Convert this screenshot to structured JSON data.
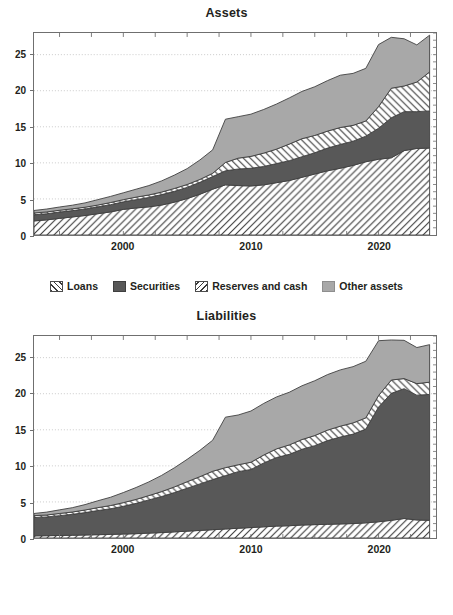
{
  "figure": {
    "background": "#ffffff",
    "colors": {
      "dark_gray": "#585858",
      "light_gray": "#a8a8a8",
      "hatch": "#3a3a3a",
      "axis": "#6f6f6f",
      "grid": "#bdbdbd",
      "text": "#231f20"
    }
  },
  "panels": [
    {
      "id": "assets",
      "title": "Assets",
      "legend": [
        {
          "label": "Loans",
          "swatch": "forward-hatch-icon"
        },
        {
          "label": "Securities",
          "swatch": "dark-gray-square-icon"
        },
        {
          "label": "Reserves and cash",
          "swatch": "back-hatch-icon"
        },
        {
          "label": "Other assets",
          "swatch": "light-gray-square-icon"
        }
      ]
    },
    {
      "id": "liabilities",
      "title": "Liabilities",
      "legend": [
        {
          "label": "Equity",
          "swatch": "forward-hatch-icon"
        },
        {
          "label": "Deposits",
          "swatch": "dark-gray-square-icon"
        },
        {
          "label": "Fed funds, repos",
          "swatch": "back-hatch-icon"
        },
        {
          "label": "Other liabilities",
          "swatch": "light-gray-square-icon"
        }
      ]
    }
  ],
  "chart_data": [
    {
      "type": "area",
      "id": "assets",
      "title": "Assets",
      "xlabel": "",
      "ylabel": "",
      "stacked": true,
      "grid": true,
      "legend_position": "below",
      "xlim": [
        1993,
        2024.5
      ],
      "ylim": [
        0,
        28
      ],
      "yticks": [
        0,
        5,
        10,
        15,
        20,
        25
      ],
      "xticks_labeled": [
        2000,
        2010,
        2020
      ],
      "x": [
        1993,
        1994,
        1995,
        1996,
        1997,
        1998,
        1999,
        2000,
        2001,
        2002,
        2003,
        2004,
        2005,
        2006,
        2007,
        2008,
        2009,
        2010,
        2011,
        2012,
        2013,
        2014,
        2015,
        2016,
        2017,
        2018,
        2019,
        2020,
        2021,
        2022,
        2023,
        2024
      ],
      "series": [
        {
          "name": "Loans",
          "values": [
            1.95,
            2.1,
            2.3,
            2.5,
            2.7,
            2.95,
            3.2,
            3.55,
            3.75,
            3.9,
            4.15,
            4.55,
            5.05,
            5.65,
            6.35,
            6.95,
            6.85,
            6.8,
            6.95,
            7.25,
            7.55,
            8.0,
            8.45,
            8.9,
            9.25,
            9.65,
            10.15,
            10.5,
            10.7,
            11.7,
            12.0,
            12.05
          ]
        },
        {
          "name": "Securities",
          "values": [
            0.85,
            0.85,
            0.88,
            0.88,
            0.9,
            0.95,
            1.0,
            1.05,
            1.15,
            1.3,
            1.45,
            1.5,
            1.55,
            1.65,
            1.75,
            1.95,
            2.3,
            2.45,
            2.55,
            2.65,
            2.75,
            2.85,
            2.95,
            3.15,
            3.3,
            3.35,
            3.55,
            4.3,
            5.55,
            5.4,
            5.1,
            5.15
          ]
        },
        {
          "name": "Reserves and cash",
          "values": [
            0.25,
            0.25,
            0.25,
            0.25,
            0.25,
            0.25,
            0.3,
            0.3,
            0.35,
            0.35,
            0.35,
            0.4,
            0.4,
            0.4,
            0.45,
            1.15,
            1.5,
            1.65,
            1.85,
            2.0,
            2.3,
            2.5,
            2.4,
            2.35,
            2.35,
            2.2,
            2.1,
            3.0,
            4.1,
            3.55,
            4.1,
            5.4
          ]
        },
        {
          "name": "Other assets",
          "values": [
            0.35,
            0.4,
            0.45,
            0.5,
            0.6,
            0.75,
            0.85,
            0.95,
            1.1,
            1.3,
            1.55,
            1.85,
            2.2,
            2.7,
            3.25,
            6.0,
            5.75,
            5.85,
            6.05,
            6.25,
            6.4,
            6.55,
            6.75,
            7.0,
            7.25,
            7.2,
            7.3,
            8.6,
            7.05,
            6.55,
            5.15,
            5.1
          ]
        }
      ]
    },
    {
      "type": "area",
      "id": "liabilities",
      "title": "Liabilities",
      "xlabel": "",
      "ylabel": "",
      "stacked": true,
      "grid": true,
      "legend_position": "below",
      "xlim": [
        1993,
        2024.5
      ],
      "ylim": [
        0,
        28
      ],
      "yticks": [
        0,
        5,
        10,
        15,
        20,
        25
      ],
      "xticks_labeled": [
        2000,
        2010,
        2020
      ],
      "x": [
        1993,
        1994,
        1995,
        1996,
        1997,
        1998,
        1999,
        2000,
        2001,
        2002,
        2003,
        2004,
        2005,
        2006,
        2007,
        2008,
        2009,
        2010,
        2011,
        2012,
        2013,
        2014,
        2015,
        2016,
        2017,
        2018,
        2019,
        2020,
        2021,
        2022,
        2023,
        2024
      ],
      "series": [
        {
          "name": "Equity",
          "values": [
            0.3,
            0.32,
            0.35,
            0.38,
            0.42,
            0.46,
            0.5,
            0.55,
            0.6,
            0.68,
            0.75,
            0.85,
            0.95,
            1.05,
            1.15,
            1.25,
            1.35,
            1.45,
            1.55,
            1.65,
            1.7,
            1.8,
            1.85,
            1.9,
            1.95,
            2.0,
            2.1,
            2.25,
            2.45,
            2.7,
            2.5,
            2.45
          ]
        },
        {
          "name": "Deposits",
          "values": [
            2.55,
            2.6,
            2.75,
            2.9,
            3.1,
            3.35,
            3.55,
            3.85,
            4.2,
            4.6,
            5.0,
            5.45,
            5.95,
            6.45,
            6.95,
            7.4,
            7.85,
            8.05,
            8.85,
            9.5,
            9.9,
            10.5,
            10.95,
            11.6,
            12.05,
            12.4,
            13.0,
            15.9,
            17.6,
            18.0,
            17.3,
            17.45
          ]
        },
        {
          "name": "Fed funds, repos",
          "values": [
            0.25,
            0.27,
            0.3,
            0.32,
            0.36,
            0.4,
            0.45,
            0.5,
            0.55,
            0.6,
            0.68,
            0.78,
            0.9,
            1.0,
            1.15,
            1.1,
            0.95,
            1.0,
            1.1,
            1.2,
            1.3,
            1.35,
            1.4,
            1.45,
            1.5,
            1.55,
            1.55,
            1.6,
            1.85,
            1.4,
            1.6,
            1.7
          ]
        },
        {
          "name": "Other liabilities",
          "values": [
            0.3,
            0.4,
            0.5,
            0.6,
            0.75,
            0.95,
            1.15,
            1.4,
            1.65,
            1.9,
            2.25,
            2.65,
            3.1,
            3.65,
            4.3,
            7.0,
            6.9,
            7.1,
            7.15,
            7.2,
            7.3,
            7.45,
            7.6,
            7.7,
            7.8,
            7.8,
            7.85,
            7.6,
            5.55,
            5.3,
            5.0,
            5.2
          ]
        }
      ]
    }
  ]
}
